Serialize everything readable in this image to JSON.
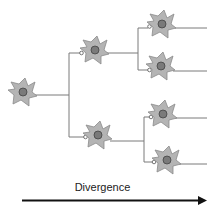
{
  "diagram": {
    "label": "Divergence",
    "colors": {
      "soma": "#b4b4b4",
      "soma_stroke": "#8a8a8a",
      "nucleus": "#7a7a7a",
      "line": "#7a7a7a",
      "arrow": "#111111"
    },
    "neurons": [
      {
        "id": "A",
        "cx": 23,
        "cy": 92
      },
      {
        "id": "B",
        "cx": 95,
        "cy": 50
      },
      {
        "id": "C",
        "cx": 98,
        "cy": 135
      },
      {
        "id": "D",
        "cx": 162,
        "cy": 24
      },
      {
        "id": "E",
        "cx": 161,
        "cy": 66
      },
      {
        "id": "F",
        "cx": 163,
        "cy": 114
      },
      {
        "id": "G",
        "cx": 167,
        "cy": 160
      }
    ]
  }
}
